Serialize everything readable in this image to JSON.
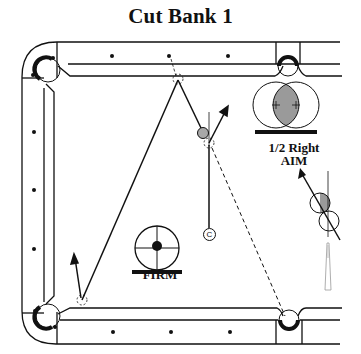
{
  "title": "Cut Bank 1",
  "labels": {
    "aim_line1": "1/2 Right",
    "aim_line2": "AIM",
    "speed": "FIRM",
    "cue_ball_marker": "C"
  },
  "colors": {
    "ink": "#111111",
    "object_ball_fill": "#a8a8a8",
    "overlap_fill": "#9a9a9a",
    "background": "#ffffff"
  },
  "diagram": {
    "type": "billiards-shot-diagram",
    "shot_name": "Cut Bank 1",
    "aim": "1/2 Right",
    "speed": "FIRM",
    "elements": [
      "table-rails",
      "corner-pockets",
      "side-pockets",
      "diamonds",
      "cue-ball-path",
      "object-ball-path",
      "aim-diagram",
      "english-diagram",
      "cue-stick"
    ]
  }
}
